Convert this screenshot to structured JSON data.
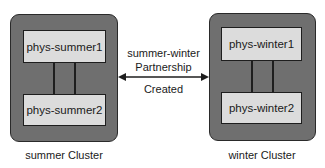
{
  "clusters": {
    "summer": {
      "label": "summer Cluster",
      "nodes": [
        "phys-summer1",
        "phys-summer2"
      ]
    },
    "winter": {
      "label": "winter Cluster",
      "nodes": [
        "phys-winter1",
        "phys-winter2"
      ]
    }
  },
  "partnership": {
    "line1": "summer-winter",
    "line2": "Partnership",
    "line3": "Created",
    "direction": "bidirectional"
  },
  "colors": {
    "cluster_fill": "#6f6f6f",
    "node_fill": "#dcdcdc",
    "stroke": "#1e1e1e"
  }
}
